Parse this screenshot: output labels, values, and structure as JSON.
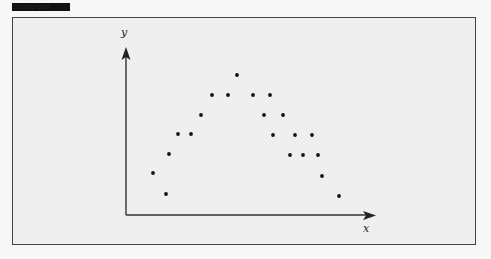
{
  "header": {
    "tag_label": "Scatter plot"
  },
  "chart_data": {
    "type": "scatter",
    "title": "",
    "xlabel": "x",
    "ylabel": "y",
    "axis_ticks": "none",
    "grid": false,
    "legend": "none",
    "xlim": [
      0,
      25
    ],
    "ylim": [
      0,
      8.35
    ],
    "points": [
      {
        "x": 2.7,
        "y": 2.1
      },
      {
        "x": 4.0,
        "y": 1.05
      },
      {
        "x": 4.3,
        "y": 3.05
      },
      {
        "x": 5.2,
        "y": 4.05
      },
      {
        "x": 6.5,
        "y": 4.05
      },
      {
        "x": 7.5,
        "y": 5.0
      },
      {
        "x": 8.6,
        "y": 6.0
      },
      {
        "x": 10.2,
        "y": 6.0
      },
      {
        "x": 11.1,
        "y": 7.0
      },
      {
        "x": 12.7,
        "y": 6.0
      },
      {
        "x": 14.4,
        "y": 6.0
      },
      {
        "x": 13.8,
        "y": 5.0
      },
      {
        "x": 15.7,
        "y": 5.0
      },
      {
        "x": 14.7,
        "y": 4.0
      },
      {
        "x": 16.9,
        "y": 4.0
      },
      {
        "x": 18.6,
        "y": 4.0
      },
      {
        "x": 16.4,
        "y": 3.0
      },
      {
        "x": 17.7,
        "y": 3.0
      },
      {
        "x": 19.2,
        "y": 3.0
      },
      {
        "x": 19.6,
        "y": 1.95
      },
      {
        "x": 21.3,
        "y": 0.95
      }
    ],
    "marker_color": "#111111",
    "axis_color": "#333333"
  }
}
